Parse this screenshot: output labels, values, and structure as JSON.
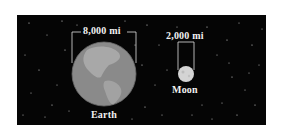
{
  "diagram": {
    "type": "size-comparison",
    "background_color": "#050505",
    "bodies": [
      {
        "name": "Earth",
        "diameter_label": "8,000 mi",
        "color": "#8f8f8f"
      },
      {
        "name": "Moon",
        "diameter_label": "2,000 mi",
        "color": "#d6d6d6"
      }
    ]
  }
}
